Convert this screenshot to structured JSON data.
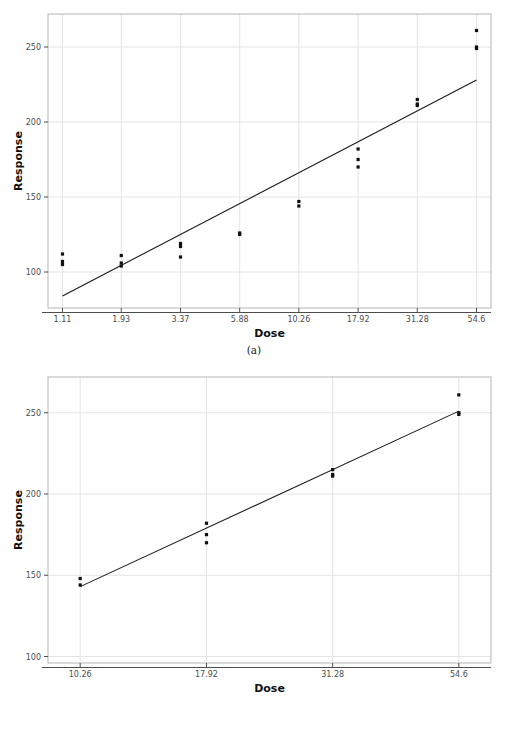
{
  "figure": {
    "panels": [
      {
        "id": "a",
        "caption": "(a)",
        "chart_ref": 0
      },
      {
        "id": "b",
        "caption": "(b)",
        "chart_ref": 1
      }
    ]
  },
  "chart_data": [
    {
      "type": "scatter",
      "title": "",
      "subtitle": "",
      "xlabel": "Dose",
      "ylabel": "Response",
      "x_scale": "log-categorical",
      "x_tick_labels": [
        "1.11",
        "1.93",
        "3.37",
        "5.88",
        "10.26",
        "17.92",
        "31.28",
        "54.6"
      ],
      "x_tick_values": [
        1.11,
        1.93,
        3.37,
        5.88,
        10.26,
        17.92,
        31.28,
        54.6
      ],
      "y_tick_labels": [
        "100",
        "150",
        "200",
        "250"
      ],
      "y_tick_values": [
        100,
        150,
        200,
        250
      ],
      "ylim": [
        76,
        272
      ],
      "grid": true,
      "legend": "none",
      "points": [
        {
          "x": 1.11,
          "y": 112
        },
        {
          "x": 1.11,
          "y": 107
        },
        {
          "x": 1.11,
          "y": 105
        },
        {
          "x": 1.93,
          "y": 111
        },
        {
          "x": 1.93,
          "y": 106
        },
        {
          "x": 1.93,
          "y": 104
        },
        {
          "x": 3.37,
          "y": 119
        },
        {
          "x": 3.37,
          "y": 117
        },
        {
          "x": 3.37,
          "y": 110
        },
        {
          "x": 5.88,
          "y": 126
        },
        {
          "x": 5.88,
          "y": 125
        },
        {
          "x": 10.26,
          "y": 147
        },
        {
          "x": 10.26,
          "y": 144
        },
        {
          "x": 17.92,
          "y": 182
        },
        {
          "x": 17.92,
          "y": 175
        },
        {
          "x": 17.92,
          "y": 170
        },
        {
          "x": 31.28,
          "y": 215
        },
        {
          "x": 31.28,
          "y": 212
        },
        {
          "x": 31.28,
          "y": 211
        },
        {
          "x": 54.6,
          "y": 261
        },
        {
          "x": 54.6,
          "y": 250
        },
        {
          "x": 54.6,
          "y": 249
        }
      ],
      "fit_line": {
        "style": "solid",
        "x_start": 1.11,
        "y_start": 84,
        "x_end": 54.6,
        "y_end": 228
      }
    },
    {
      "type": "scatter",
      "title": "",
      "subtitle": "",
      "xlabel": "Dose",
      "ylabel": "Response",
      "x_scale": "log-categorical",
      "x_tick_labels": [
        "10.26",
        "17.92",
        "31.28",
        "54.6"
      ],
      "x_tick_values": [
        10.26,
        17.92,
        31.28,
        54.6
      ],
      "y_tick_labels": [
        "100",
        "150",
        "200",
        "250"
      ],
      "y_tick_values": [
        100,
        150,
        200,
        250
      ],
      "ylim": [
        96,
        272
      ],
      "grid": true,
      "legend": "none",
      "points": [
        {
          "x": 10.26,
          "y": 148
        },
        {
          "x": 10.26,
          "y": 144
        },
        {
          "x": 17.92,
          "y": 182
        },
        {
          "x": 17.92,
          "y": 175
        },
        {
          "x": 17.92,
          "y": 170
        },
        {
          "x": 31.28,
          "y": 215
        },
        {
          "x": 31.28,
          "y": 212
        },
        {
          "x": 31.28,
          "y": 211
        },
        {
          "x": 54.6,
          "y": 261
        },
        {
          "x": 54.6,
          "y": 250
        },
        {
          "x": 54.6,
          "y": 249
        }
      ],
      "fit_line": {
        "style": "solid",
        "x_start": 10.26,
        "y_start": 143,
        "x_end": 54.6,
        "y_end": 251
      }
    }
  ],
  "colors": {
    "point": "#111111",
    "line": "#1a1a1a",
    "grid": "#e4e4e4",
    "frame": "#b5b5b5",
    "tick_text": "#4d4d4d",
    "axis_title": "#111111",
    "background": "#ffffff"
  }
}
